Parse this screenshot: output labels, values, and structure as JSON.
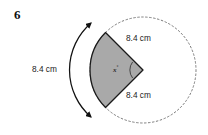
{
  "question": {
    "number": "6"
  },
  "figure": {
    "type": "circle-sector-diagram",
    "shape_name": "shaded-sector",
    "fill_color": "#a9a9a9",
    "stroke_color": "#1a1a1a",
    "dashed_circle_color": "#7a7a7a",
    "arrow_color": "#111111",
    "labels": {
      "arc_length": "8.4 cm",
      "radius_top": "8.4 cm",
      "radius_bottom": "8.4 cm",
      "angle_variable": "x",
      "angle_unit": "°"
    }
  }
}
